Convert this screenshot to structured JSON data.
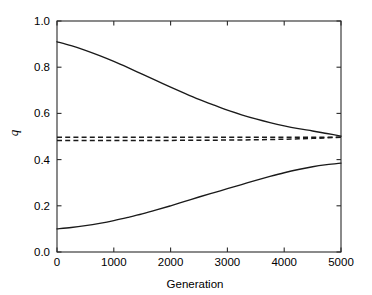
{
  "chart_data": {
    "type": "line",
    "title": "",
    "subtitle": "",
    "xlabel": "Generation",
    "ylabel": "q",
    "xlim": [
      0,
      5000
    ],
    "ylim": [
      0.0,
      1.0
    ],
    "xticks": [
      0,
      1000,
      2000,
      3000,
      4000,
      5000
    ],
    "xtick_labels": [
      "0",
      "1000",
      "2000",
      "3000",
      "4000",
      "5000"
    ],
    "yticks": [
      0.0,
      0.2,
      0.4,
      0.6,
      0.8,
      1.0
    ],
    "ytick_labels": [
      "0.0",
      "0.2",
      "0.4",
      "0.6",
      "0.8",
      "1.0"
    ],
    "grid": false,
    "legend": "none",
    "frame": "box",
    "colors": {
      "axis": "#2b2b2b",
      "series": "#1a1a1a",
      "background": "#ffffff"
    },
    "x": [
      0,
      250,
      500,
      750,
      1000,
      1250,
      1500,
      1750,
      2000,
      2250,
      2500,
      2750,
      3000,
      3250,
      3500,
      3750,
      4000,
      4250,
      4500,
      4750,
      5000
    ],
    "series": [
      {
        "name": "upper-solid",
        "style": "solid",
        "values": [
          0.91,
          0.893,
          0.873,
          0.85,
          0.825,
          0.798,
          0.77,
          0.742,
          0.714,
          0.687,
          0.661,
          0.637,
          0.614,
          0.594,
          0.576,
          0.56,
          0.546,
          0.534,
          0.524,
          0.513,
          0.502
        ]
      },
      {
        "name": "lower-solid",
        "style": "solid",
        "values": [
          0.1,
          0.106,
          0.114,
          0.124,
          0.136,
          0.15,
          0.165,
          0.182,
          0.2,
          0.219,
          0.238,
          0.256,
          0.274,
          0.292,
          0.31,
          0.327,
          0.343,
          0.357,
          0.369,
          0.378,
          0.385
        ]
      },
      {
        "name": "dashed-upper-equilibrium",
        "style": "dashed",
        "values": [
          0.497,
          0.497,
          0.497,
          0.497,
          0.497,
          0.497,
          0.497,
          0.497,
          0.497,
          0.497,
          0.497,
          0.497,
          0.497,
          0.497,
          0.497,
          0.497,
          0.497,
          0.497,
          0.497,
          0.497,
          0.497
        ]
      },
      {
        "name": "dashed-lower-equilibrium",
        "style": "dashed",
        "values": [
          0.483,
          0.483,
          0.483,
          0.483,
          0.483,
          0.483,
          0.483,
          0.483,
          0.483,
          0.484,
          0.484,
          0.484,
          0.485,
          0.485,
          0.486,
          0.487,
          0.488,
          0.49,
          0.492,
          0.494,
          0.497
        ]
      }
    ]
  }
}
